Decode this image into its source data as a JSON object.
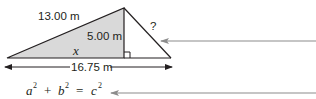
{
  "diagram": {
    "labels": {
      "hypotenuse_left": "13.00 m",
      "height": "5.00 m",
      "base_segment": "x",
      "hypotenuse_right": "?",
      "total_base": "16.75 m"
    },
    "equation": {
      "a": "a",
      "b": "b",
      "c": "c",
      "exp": "2",
      "plus": "+",
      "equals": "="
    },
    "colors": {
      "shade_fill": "#d9d9d9",
      "stroke": "#231f20",
      "pointer_arrow": "#8c8c8c"
    },
    "right_angle_marker": true
  }
}
